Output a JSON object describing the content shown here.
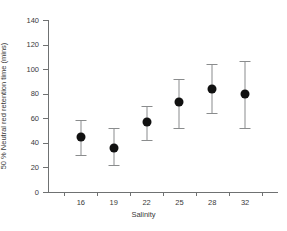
{
  "chart_data": {
    "type": "scatter",
    "title": "",
    "xlabel": "Salinity",
    "ylabel": "50 % Neutral red retention time (mins)",
    "categories": [
      "16",
      "19",
      "22",
      "25",
      "28",
      "32"
    ],
    "values": [
      45,
      36,
      57,
      73,
      84,
      80
    ],
    "error_low": [
      30,
      22,
      42,
      52,
      64,
      52
    ],
    "error_high": [
      59,
      52,
      70,
      92,
      104,
      107
    ],
    "ylim": [
      0,
      140
    ],
    "yticks": [
      "0",
      "20",
      "40",
      "60",
      "80",
      "100",
      "120",
      "140"
    ],
    "ytick_values": [
      0,
      20,
      40,
      60,
      80,
      100,
      120,
      140
    ],
    "grid": false,
    "legend": "none",
    "marker_color": "#111111",
    "errorbar_color": "#8a8c8d",
    "axis_color": "#6f7172"
  }
}
